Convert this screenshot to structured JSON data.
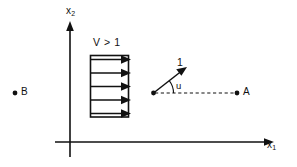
{
  "figure": {
    "axes": {
      "x_axis_label_main": "x",
      "x_axis_label_sub": "1",
      "y_axis_label_main": "x",
      "y_axis_label_sub": "2"
    },
    "flow_region": {
      "speed_label": "V > 1",
      "arrow_count": 5
    },
    "vector": {
      "magnitude_label": "1",
      "angle_label": "u"
    },
    "points": [
      {
        "id": "point-a",
        "label": "A"
      },
      {
        "id": "point-b",
        "label": "B"
      }
    ],
    "colors": {
      "ink": "#111111",
      "background": "#ffffff"
    }
  }
}
